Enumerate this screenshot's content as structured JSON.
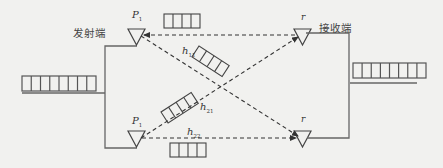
{
  "diagram": {
    "type": "2x2 MIMO transmission schematic",
    "colors": {
      "background": "#f1f1ef",
      "line": "#555555",
      "dash": "#333333"
    },
    "labels": {
      "transmitter": "发射端",
      "receiver": "接收端",
      "tx_antenna_top": "P",
      "tx_antenna_top_sub": "1",
      "tx_antenna_bottom": "P",
      "tx_antenna_bottom_sub": "1",
      "rx_antenna_top": "r",
      "rx_antenna_bottom": "r",
      "h11": "h",
      "h11_sub": "11",
      "h21": "h",
      "h21_sub": "21",
      "h22": "h",
      "h22_sub": "22"
    },
    "buffers": {
      "input_cells": 8,
      "output_cells": 8,
      "stream_cells": 4
    },
    "links": [
      {
        "from": "P1-top",
        "to": "r-top",
        "style": "dashed"
      },
      {
        "from": "P1-top",
        "to": "r-bottom",
        "style": "dashed"
      },
      {
        "from": "P1-bottom",
        "to": "r-top",
        "style": "dashed"
      },
      {
        "from": "P1-bottom",
        "to": "r-bottom",
        "style": "dashed"
      }
    ]
  }
}
